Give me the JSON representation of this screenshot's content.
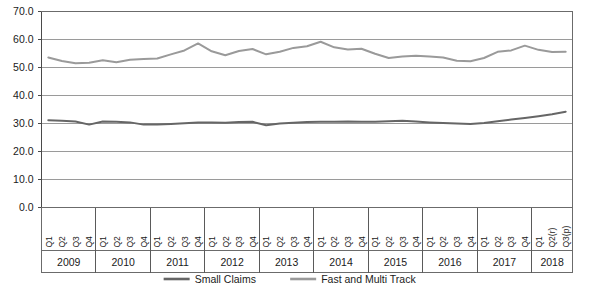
{
  "chart_data": {
    "type": "line",
    "title": "",
    "subtitle": "",
    "xlabel": "",
    "ylabel": "",
    "ylim": [
      0.0,
      70.0
    ],
    "grid": true,
    "legend_position": "bottom",
    "ytick_labels": [
      "70.0",
      "60.0",
      "50.0",
      "40.0",
      "30.0",
      "20.0",
      "10.0",
      "0.0"
    ],
    "ytick_values": [
      70.0,
      60.0,
      50.0,
      40.0,
      30.0,
      20.0,
      10.0,
      0.0
    ],
    "categories": [
      "Q1",
      "Q2",
      "Q3",
      "Q4",
      "Q1",
      "Q2",
      "Q3",
      "Q4",
      "Q1",
      "Q2",
      "Q3",
      "Q4",
      "Q1",
      "Q2",
      "Q3",
      "Q4",
      "Q1",
      "Q2",
      "Q3",
      "Q4",
      "Q1",
      "Q2",
      "Q3",
      "Q4",
      "Q1",
      "Q2",
      "Q3",
      "Q4",
      "Q1",
      "Q2",
      "Q3",
      "Q4",
      "Q1",
      "Q2",
      "Q3",
      "Q4",
      "Q1",
      "Q2(r)",
      "Q3(p)"
    ],
    "year_groups": [
      {
        "label": "2009",
        "count": 4
      },
      {
        "label": "2010",
        "count": 4
      },
      {
        "label": "2011",
        "count": 4
      },
      {
        "label": "2012",
        "count": 4
      },
      {
        "label": "2013",
        "count": 4
      },
      {
        "label": "2014",
        "count": 4
      },
      {
        "label": "2015",
        "count": 4
      },
      {
        "label": "2016",
        "count": 4
      },
      {
        "label": "2017",
        "count": 4
      },
      {
        "label": "2018",
        "count": 3
      }
    ],
    "series": [
      {
        "name": "Small Claims",
        "color": "#666666",
        "values": [
          31.2,
          31.0,
          30.7,
          29.6,
          30.7,
          30.6,
          30.4,
          29.6,
          29.6,
          29.8,
          30.1,
          30.4,
          30.4,
          30.3,
          30.5,
          30.6,
          29.4,
          30.0,
          30.3,
          30.5,
          30.6,
          30.6,
          30.7,
          30.6,
          30.6,
          30.8,
          31.0,
          30.7,
          30.4,
          30.2,
          30.0,
          29.8,
          30.2,
          30.8,
          31.4,
          32.0,
          32.6,
          33.3,
          34.2
        ]
      },
      {
        "name": "Fast and Multi Track",
        "color": "#9a9a9a",
        "values": [
          53.6,
          52.3,
          51.5,
          51.7,
          52.6,
          51.9,
          52.8,
          53.0,
          53.2,
          54.7,
          56.1,
          58.6,
          55.8,
          54.4,
          55.9,
          56.6,
          54.7,
          55.6,
          57.0,
          57.6,
          59.2,
          57.2,
          56.4,
          56.7,
          54.9,
          53.4,
          53.9,
          54.2,
          53.9,
          53.6,
          52.4,
          52.2,
          53.4,
          55.6,
          56.1,
          57.8,
          56.3,
          55.5,
          55.6
        ]
      }
    ]
  },
  "legend": {
    "items": [
      {
        "label": "Small Claims",
        "color": "#666666"
      },
      {
        "label": "Fast and Multi Track",
        "color": "#9a9a9a"
      }
    ]
  }
}
